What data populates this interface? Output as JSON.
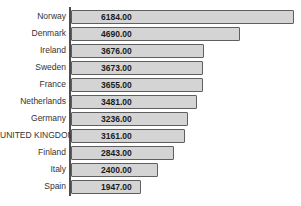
{
  "chart_data": {
    "type": "bar",
    "orientation": "horizontal",
    "title": "",
    "xlabel": "",
    "ylabel": "",
    "grid": false,
    "legend": null,
    "xlim": [
      0,
      6400
    ],
    "categories": [
      "Norway",
      "Denmark",
      "Ireland",
      "Sweden",
      "France",
      "Netherlands",
      "Germany",
      "UNITED KINGDOM",
      "Finland",
      "Italy",
      "Spain"
    ],
    "values": [
      6184.0,
      4690.0,
      3676.0,
      3673.0,
      3655.0,
      3481.0,
      3236.0,
      3161.0,
      2843.0,
      2400.0,
      1947.0
    ],
    "value_labels": [
      "6184.00",
      "4690.00",
      "3676.00",
      "3673.00",
      "3655.00",
      "3481.00",
      "3236.00",
      "3161.00",
      "2843.00",
      "2400.00",
      "1947.00"
    ],
    "colors": {
      "bar_fill": "#d4d4d4",
      "bar_border": "#5f5f5f",
      "axis_line": "#4d4d4d",
      "category_text": "#333333",
      "value_text": "#1a1a1a",
      "background": "#ffffff"
    }
  }
}
